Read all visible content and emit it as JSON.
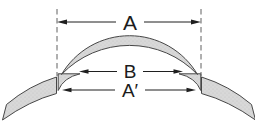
{
  "diagram": {
    "type": "technical-cross-section",
    "dimension_labels": {
      "overall_width": "A",
      "inner_width": "B",
      "seat_width": "A′"
    },
    "colors": {
      "material_fill": "#d8d8d8",
      "stipple_dot": "#c2c2c2",
      "outline": "#474747",
      "dimension_line": "#1f1f1f",
      "extension_line": "#606060",
      "background": "#ffffff"
    }
  }
}
